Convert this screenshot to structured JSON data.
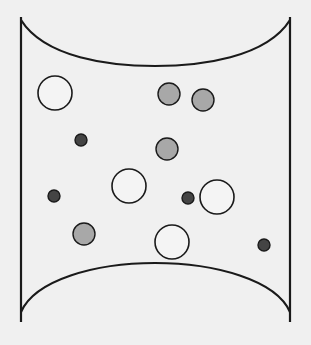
{
  "diagram": {
    "colors": {
      "background": "#f0f0f0",
      "outline": "#1a1a1a",
      "gray_fill": "#a8a8a8",
      "dark_fill": "#444444",
      "hollow_fill": "#f4f4f4"
    },
    "container": {
      "left_x": 21,
      "right_x": 290,
      "top_y": 17,
      "bottom_y": 322,
      "top_arc_dip_y": 66,
      "bottom_arc_peak_y": 263
    },
    "particles": [
      {
        "type": "large-hollow",
        "cx": 55,
        "cy": 93,
        "r": 17
      },
      {
        "type": "medium-gray",
        "cx": 169,
        "cy": 94,
        "r": 11
      },
      {
        "type": "medium-gray",
        "cx": 203,
        "cy": 100,
        "r": 11
      },
      {
        "type": "small-dark",
        "cx": 81,
        "cy": 140,
        "r": 6
      },
      {
        "type": "medium-gray",
        "cx": 167,
        "cy": 149,
        "r": 11
      },
      {
        "type": "large-hollow",
        "cx": 129,
        "cy": 186,
        "r": 17
      },
      {
        "type": "small-dark",
        "cx": 54,
        "cy": 196,
        "r": 6
      },
      {
        "type": "small-dark",
        "cx": 188,
        "cy": 198,
        "r": 6
      },
      {
        "type": "large-hollow",
        "cx": 217,
        "cy": 197,
        "r": 17
      },
      {
        "type": "medium-gray",
        "cx": 84,
        "cy": 234,
        "r": 11
      },
      {
        "type": "large-hollow",
        "cx": 172,
        "cy": 242,
        "r": 17
      },
      {
        "type": "small-dark",
        "cx": 264,
        "cy": 245,
        "r": 6
      }
    ]
  }
}
